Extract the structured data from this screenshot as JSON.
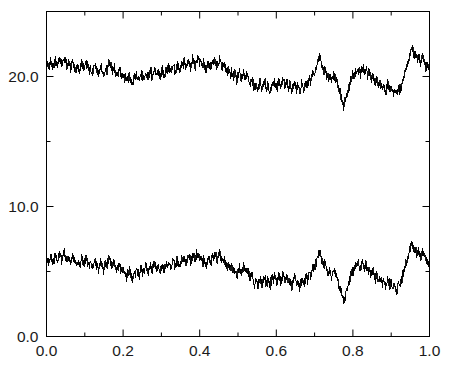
{
  "chart_data": {
    "type": "line",
    "title": "",
    "subtitle": "",
    "xlabel": "",
    "ylabel": "",
    "xlim": [
      0.0,
      1.0
    ],
    "ylim": [
      0.0,
      25.0
    ],
    "grid": false,
    "legend": false,
    "legend_position": "none",
    "background_color": "#ffffff",
    "line_color": "#000000",
    "line_width": 0.9,
    "axis_color": "#000000",
    "frame": "box",
    "tick_direction": "in",
    "x_ticks_major": [
      0.0,
      0.2,
      0.4,
      0.6,
      0.8,
      1.0
    ],
    "x_ticklabels": [
      "0.0",
      "0.2",
      "0.4",
      "0.6",
      "0.8",
      "1.0"
    ],
    "x_ticks_minor": [
      0.1,
      0.3,
      0.5,
      0.7,
      0.9
    ],
    "y_ticks_major": [
      0.0,
      10.0,
      20.0
    ],
    "y_ticklabels": [
      "0.0",
      "10.0",
      "20.0"
    ],
    "y_ticks_minor": [
      5.0,
      15.0
    ],
    "series": [
      {
        "name": "upper-trace",
        "offset": 15.0,
        "color": "#000000",
        "description": "noisy random walk fluctuating about 20",
        "values": [
          20.9,
          21.0,
          20.7,
          20.9,
          21.2,
          20.9,
          20.7,
          21.0,
          21.3,
          21.0,
          20.8,
          21.1,
          21.4,
          21.2,
          20.9,
          21.2,
          21.5,
          21.2,
          21.0,
          20.8,
          21.1,
          20.9,
          20.6,
          20.9,
          21.2,
          20.9,
          20.7,
          20.5,
          20.8,
          20.6,
          20.4,
          20.7,
          21.0,
          20.8,
          20.5,
          20.8,
          21.1,
          20.9,
          20.6,
          20.4,
          20.7,
          20.5,
          20.3,
          20.6,
          20.9,
          20.7,
          20.4,
          20.2,
          20.5,
          20.8,
          20.6,
          20.3,
          20.1,
          20.4,
          20.7,
          20.5,
          20.8,
          21.1,
          20.9,
          20.6,
          20.4,
          20.7,
          20.5,
          20.2,
          20.0,
          20.3,
          20.6,
          20.4,
          20.1,
          19.9,
          20.2,
          20.0,
          19.7,
          19.5,
          19.8,
          20.1,
          19.9,
          19.6,
          19.4,
          19.7,
          20.0,
          19.8,
          20.1,
          19.9,
          19.6,
          19.9,
          20.2,
          20.0,
          19.8,
          20.1,
          20.4,
          20.2,
          19.9,
          20.2,
          20.5,
          20.3,
          20.0,
          20.3,
          20.6,
          20.4,
          20.1,
          20.4,
          20.2,
          19.9,
          20.2,
          20.5,
          20.3,
          20.0,
          20.3,
          20.6,
          20.4,
          20.7,
          20.5,
          20.2,
          20.5,
          20.8,
          20.6,
          20.3,
          20.6,
          20.9,
          20.7,
          20.4,
          20.7,
          21.0,
          20.8,
          21.1,
          20.9,
          20.6,
          20.9,
          21.2,
          21.0,
          20.7,
          21.0,
          21.3,
          21.1,
          20.8,
          21.1,
          21.4,
          21.2,
          20.9,
          21.2,
          21.0,
          20.7,
          21.0,
          20.8,
          20.5,
          20.8,
          21.1,
          20.9,
          20.6,
          20.9,
          21.2,
          21.0,
          21.3,
          21.1,
          20.8,
          21.1,
          21.4,
          21.2,
          20.9,
          20.7,
          21.0,
          20.8,
          20.5,
          20.3,
          20.6,
          20.4,
          20.1,
          20.4,
          20.2,
          19.9,
          20.2,
          20.0,
          19.7,
          20.0,
          20.3,
          20.1,
          19.8,
          20.1,
          20.4,
          20.2,
          19.9,
          20.2,
          20.0,
          19.7,
          19.5,
          19.8,
          19.6,
          19.3,
          19.1,
          19.4,
          19.2,
          18.9,
          19.2,
          19.5,
          19.3,
          19.0,
          19.3,
          19.6,
          19.4,
          19.1,
          19.4,
          19.2,
          18.9,
          19.2,
          19.5,
          19.3,
          19.6,
          19.4,
          19.1,
          19.4,
          19.7,
          19.5,
          19.2,
          19.5,
          19.8,
          19.6,
          19.3,
          19.6,
          19.4,
          19.1,
          19.4,
          19.2,
          18.9,
          19.2,
          19.5,
          19.3,
          19.0,
          19.3,
          19.1,
          18.8,
          19.1,
          19.4,
          19.2,
          18.9,
          19.2,
          19.5,
          19.3,
          19.6,
          19.9,
          19.7,
          20.0,
          20.3,
          20.1,
          20.4,
          20.7,
          21.0,
          21.3,
          21.6,
          21.3,
          21.0,
          20.7,
          20.4,
          20.6,
          20.3,
          20.0,
          19.8,
          20.1,
          19.9,
          19.6,
          19.9,
          20.2,
          20.0,
          19.7,
          19.5,
          19.2,
          18.9,
          18.6,
          18.3,
          18.0,
          17.7,
          18.0,
          18.3,
          18.6,
          18.9,
          19.2,
          19.5,
          19.8,
          20.1,
          19.9,
          20.2,
          20.5,
          20.3,
          20.6,
          20.4,
          20.1,
          20.4,
          20.7,
          20.5,
          20.2,
          20.5,
          20.3,
          20.0,
          20.3,
          20.1,
          19.8,
          20.1,
          19.9,
          19.6,
          19.4,
          19.7,
          19.5,
          19.2,
          19.5,
          19.3,
          19.0,
          19.3,
          19.1,
          18.8,
          19.1,
          19.4,
          19.2,
          18.9,
          19.2,
          19.0,
          18.7,
          19.0,
          18.8,
          18.5,
          18.8,
          19.1,
          18.9,
          19.2,
          19.5,
          19.8,
          20.1,
          20.4,
          20.7,
          21.0,
          21.3,
          21.6,
          21.9,
          22.2,
          21.9,
          21.6,
          21.9,
          21.6,
          21.3,
          21.6,
          21.3,
          21.0,
          21.3,
          21.6,
          21.3,
          21.0,
          20.7,
          21.0,
          20.7,
          21.0
        ]
      },
      {
        "name": "lower-trace",
        "offset": 0.0,
        "color": "#000000",
        "description": "identical noisy random walk fluctuating about 5, offset 15 below upper trace",
        "values": [
          5.9,
          6.0,
          5.7,
          5.9,
          6.2,
          5.9,
          5.7,
          6.0,
          6.3,
          6.0,
          5.8,
          6.1,
          6.4,
          6.2,
          5.9,
          6.2,
          6.5,
          6.2,
          6.0,
          5.8,
          6.1,
          5.9,
          5.6,
          5.9,
          6.2,
          5.9,
          5.7,
          5.5,
          5.8,
          5.6,
          5.4,
          5.7,
          6.0,
          5.8,
          5.5,
          5.8,
          6.1,
          5.9,
          5.6,
          5.4,
          5.7,
          5.5,
          5.3,
          5.6,
          5.9,
          5.7,
          5.4,
          5.2,
          5.5,
          5.8,
          5.6,
          5.3,
          5.1,
          5.4,
          5.7,
          5.5,
          5.8,
          6.1,
          5.9,
          5.6,
          5.4,
          5.7,
          5.5,
          5.2,
          5.0,
          5.3,
          5.6,
          5.4,
          5.1,
          4.9,
          5.2,
          5.0,
          4.7,
          4.5,
          4.8,
          5.1,
          4.9,
          4.6,
          4.4,
          4.7,
          5.0,
          4.8,
          5.1,
          4.9,
          4.6,
          4.9,
          5.2,
          5.0,
          4.8,
          5.1,
          5.4,
          5.2,
          4.9,
          5.2,
          5.5,
          5.3,
          5.0,
          5.3,
          5.6,
          5.4,
          5.1,
          5.4,
          5.2,
          4.9,
          5.2,
          5.5,
          5.3,
          5.0,
          5.3,
          5.6,
          5.4,
          5.7,
          5.5,
          5.2,
          5.5,
          5.8,
          5.6,
          5.3,
          5.6,
          5.9,
          5.7,
          5.4,
          5.7,
          6.0,
          5.8,
          6.1,
          5.9,
          5.6,
          5.9,
          6.2,
          6.0,
          5.7,
          6.0,
          6.3,
          6.1,
          5.8,
          6.1,
          6.4,
          6.2,
          5.9,
          6.2,
          6.0,
          5.7,
          6.0,
          5.8,
          5.5,
          5.8,
          6.1,
          5.9,
          5.6,
          5.9,
          6.2,
          6.0,
          6.3,
          6.1,
          5.8,
          6.1,
          6.4,
          6.2,
          5.9,
          5.7,
          6.0,
          5.8,
          5.5,
          5.3,
          5.6,
          5.4,
          5.1,
          5.4,
          5.2,
          4.9,
          5.2,
          5.0,
          4.7,
          5.0,
          5.3,
          5.1,
          4.8,
          5.1,
          5.4,
          5.2,
          4.9,
          5.2,
          5.0,
          4.7,
          4.5,
          4.8,
          4.6,
          4.3,
          4.1,
          4.4,
          4.2,
          3.9,
          4.2,
          4.5,
          4.3,
          4.0,
          4.3,
          4.6,
          4.4,
          4.1,
          4.4,
          4.2,
          3.9,
          4.2,
          4.5,
          4.3,
          4.6,
          4.4,
          4.1,
          4.4,
          4.7,
          4.5,
          4.2,
          4.5,
          4.8,
          4.6,
          4.3,
          4.6,
          4.4,
          4.1,
          4.4,
          4.2,
          3.9,
          4.2,
          4.5,
          4.3,
          4.0,
          4.3,
          4.1,
          3.8,
          4.1,
          4.4,
          4.2,
          3.9,
          4.2,
          4.5,
          4.3,
          4.6,
          4.9,
          4.7,
          5.0,
          5.3,
          5.1,
          5.4,
          5.7,
          6.0,
          6.3,
          6.6,
          6.3,
          6.0,
          5.7,
          5.4,
          5.6,
          5.3,
          5.0,
          4.8,
          5.1,
          4.9,
          4.6,
          4.9,
          5.2,
          5.0,
          4.7,
          4.5,
          4.2,
          3.9,
          3.6,
          3.3,
          3.0,
          2.7,
          3.0,
          3.3,
          3.6,
          3.9,
          4.2,
          4.5,
          4.8,
          5.1,
          4.9,
          5.2,
          5.5,
          5.3,
          5.6,
          5.4,
          5.1,
          5.4,
          5.7,
          5.5,
          5.2,
          5.5,
          5.3,
          5.0,
          5.3,
          5.1,
          4.8,
          5.1,
          4.9,
          4.6,
          4.4,
          4.7,
          4.5,
          4.2,
          4.5,
          4.3,
          4.0,
          4.3,
          4.1,
          3.8,
          4.1,
          4.4,
          4.2,
          3.9,
          4.2,
          4.0,
          3.7,
          4.0,
          3.8,
          3.5,
          3.8,
          4.1,
          3.9,
          4.2,
          4.5,
          4.8,
          5.1,
          5.4,
          5.7,
          6.0,
          6.3,
          6.6,
          6.9,
          7.2,
          6.9,
          6.6,
          6.9,
          6.6,
          6.3,
          6.6,
          6.3,
          6.0,
          6.3,
          6.6,
          6.3,
          6.0,
          5.7,
          6.0,
          5.7,
          6.0
        ]
      }
    ]
  }
}
